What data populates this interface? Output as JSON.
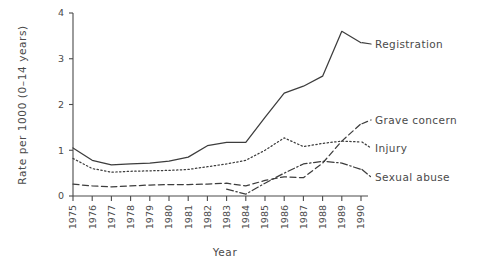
{
  "chart_data": {
    "type": "line",
    "title": "",
    "xlabel": "Year",
    "ylabel": "Rate per 1000 (0–14 years)",
    "categories": [
      "1975",
      "1976",
      "1977",
      "1978",
      "1979",
      "1980",
      "1981",
      "1982",
      "1983",
      "1984",
      "1985",
      "1986",
      "1987",
      "1988",
      "1989",
      "1990"
    ],
    "x": [
      1975,
      1976,
      1977,
      1978,
      1979,
      1980,
      1981,
      1982,
      1983,
      1984,
      1985,
      1986,
      1987,
      1988,
      1989,
      1990
    ],
    "xlim": [
      1975,
      1990
    ],
    "ylim": [
      0,
      4
    ],
    "yticks": [
      "0",
      "1",
      "2",
      "3",
      "4"
    ],
    "ytick_values": [
      0,
      1,
      2,
      3,
      4
    ],
    "grid": false,
    "legend_position": "right-inline-labels",
    "series": [
      {
        "name": "Registration",
        "linestyle": "solid",
        "color": "#3d3d3d",
        "values": [
          1.05,
          0.78,
          0.68,
          0.7,
          0.72,
          0.76,
          0.85,
          1.1,
          1.17,
          1.17,
          1.72,
          2.25,
          2.4,
          2.62,
          3.6,
          3.35
        ]
      },
      {
        "name": "Grave concern",
        "linestyle": "dashed",
        "color": "#3d3d3d",
        "values": [
          0.26,
          0.22,
          0.2,
          0.22,
          0.24,
          0.25,
          0.25,
          0.26,
          0.28,
          0.22,
          0.34,
          0.42,
          0.4,
          0.72,
          1.2,
          1.58
        ]
      },
      {
        "name": "Injury",
        "linestyle": "dotted",
        "color": "#3d3d3d",
        "values": [
          0.82,
          0.6,
          0.52,
          0.54,
          0.55,
          0.56,
          0.58,
          0.64,
          0.7,
          0.78,
          1.0,
          1.27,
          1.08,
          1.15,
          1.2,
          1.18
        ]
      },
      {
        "name": "Sexual abuse",
        "linestyle": "dashdot",
        "color": "#3d3d3d",
        "values": [
          null,
          null,
          null,
          null,
          null,
          null,
          null,
          null,
          0.15,
          0.04,
          0.28,
          0.5,
          0.7,
          0.76,
          0.72,
          0.58
        ]
      }
    ]
  },
  "axes": {
    "y_title": "Rate per 1000 (0–14 years)",
    "x_title": "Year"
  },
  "labels": {
    "registration": "Registration",
    "grave_concern": "Grave concern",
    "injury": "Injury",
    "sexual_abuse": "Sexual abuse"
  },
  "ticks": {
    "y": [
      "0",
      "1",
      "2",
      "3",
      "4"
    ],
    "x": [
      "1975",
      "1976",
      "1977",
      "1978",
      "1979",
      "1980",
      "1981",
      "1982",
      "1983",
      "1984",
      "1985",
      "1986",
      "1987",
      "1988",
      "1989",
      "1990"
    ]
  }
}
